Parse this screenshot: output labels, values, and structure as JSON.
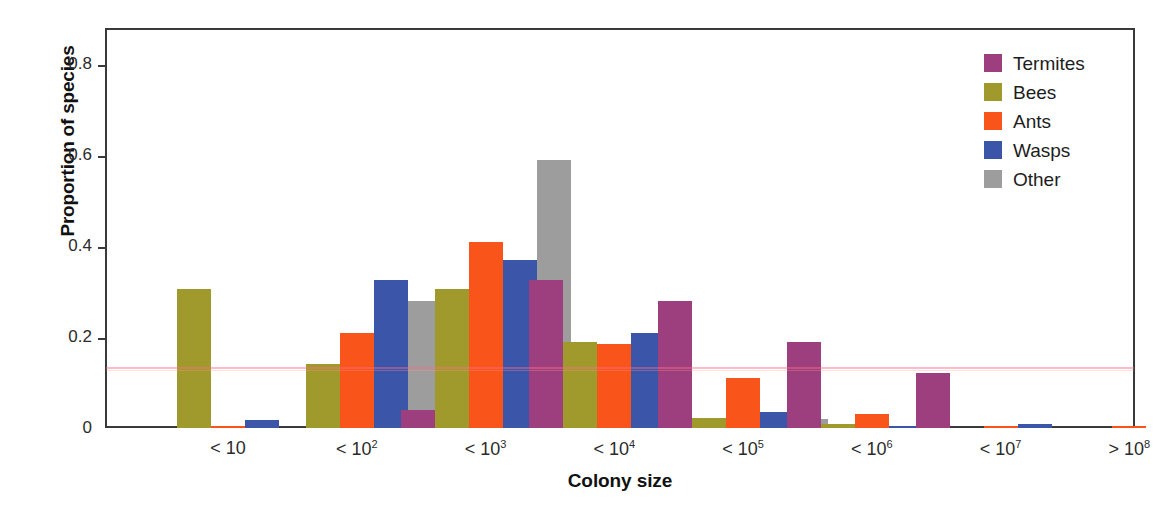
{
  "chart_data": {
    "type": "bar",
    "title": "",
    "subtitle": "",
    "xlabel": "Colony size",
    "ylabel": "Proportion of species",
    "categories": [
      "< 10",
      "< 10^2",
      "< 10^3",
      "< 10^4",
      "< 10^5",
      "< 10^6",
      "< 10^7",
      "> 10^8"
    ],
    "category_labels_html": [
      "< 10",
      "< 10<sup>2</sup>",
      "< 10<sup>3</sup>",
      "< 10<sup>4</sup>",
      "< 10<sup>5</sup>",
      "< 10<sup>6</sup>",
      "< 10<sup>7</sup>",
      "> 10<sup>8</sup>"
    ],
    "ylim": [
      0,
      0.88
    ],
    "yticks": [
      0,
      0.2,
      0.4,
      0.6,
      0.8
    ],
    "ytick_labels": [
      "0",
      "0.2",
      "0.4",
      "0.6",
      "0.8"
    ],
    "grid": false,
    "legend_position": "top-right",
    "series": [
      {
        "name": "Termites",
        "color": "#9d3f7f",
        "values": [
          0.0,
          0.0,
          0.04,
          0.325,
          0.28,
          0.19,
          0.12,
          0.0
        ]
      },
      {
        "name": "Bees",
        "color": "#a09a2c",
        "values": [
          0.305,
          0.14,
          0.305,
          0.19,
          0.023,
          0.008,
          0.0,
          0.0
        ]
      },
      {
        "name": "Ants",
        "color": "#f9541a",
        "values": [
          0.005,
          0.21,
          0.41,
          0.185,
          0.11,
          0.03,
          0.005,
          0.004
        ]
      },
      {
        "name": "Wasps",
        "color": "#3b55a8",
        "values": [
          0.018,
          0.325,
          0.37,
          0.21,
          0.035,
          0.005,
          0.008,
          0.0
        ]
      },
      {
        "name": "Other",
        "color": "#9d9d9d",
        "values": [
          0.0,
          0.28,
          0.59,
          0.022,
          0.02,
          0.0,
          0.0,
          0.045
        ]
      }
    ]
  },
  "legend": {
    "items": [
      {
        "label": "Termites",
        "color": "#9d3f7f"
      },
      {
        "label": "Bees",
        "color": "#a09a2c"
      },
      {
        "label": "Ants",
        "color": "#f9541a"
      },
      {
        "label": "Wasps",
        "color": "#3b55a8"
      },
      {
        "label": "Other",
        "color": "#9d9d9d"
      }
    ]
  },
  "axes": {
    "y_title": "Proportion of species",
    "x_title": "Colony size"
  },
  "colors": {
    "axis": "#3a3a3a",
    "text": "#1d1d1d",
    "background": "#ffffff"
  }
}
